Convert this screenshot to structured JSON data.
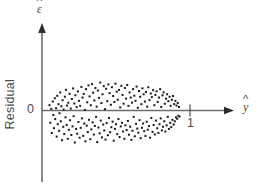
{
  "figure": {
    "background_color": "#ffffff",
    "axis_color": "#6d6d6d",
    "point_color": "#1a1a1a",
    "text_color": "#4d4d4d"
  },
  "labels": {
    "yaxis_name": "Residual",
    "yaxis_symbol_base": "ε",
    "xaxis_symbol_base": "y",
    "ytick_zero": "0",
    "xtick_one": "1"
  },
  "chart_data": {
    "type": "scatter",
    "title": "",
    "subtitle": "",
    "xlabel": "ŷ",
    "ylabel": "ε̂",
    "ylabel_text": "Residual",
    "grid": false,
    "legend": "none",
    "xlim": [
      0,
      1.35
    ],
    "ylim": [
      -0.62,
      0.62
    ],
    "xticks": [
      1
    ],
    "xticklabels": [
      "1"
    ],
    "yticks": [
      0
    ],
    "yticklabels": [
      "0"
    ],
    "annotations": [],
    "point_count": 360,
    "marker": "square",
    "marker_size_px": 2,
    "points": [
      [
        0.055,
        0.049
      ],
      [
        0.061,
        -0.112
      ],
      [
        0.068,
        0.015
      ],
      [
        0.072,
        -0.205
      ],
      [
        0.079,
        0.082
      ],
      [
        0.083,
        -0.041
      ],
      [
        0.088,
        -0.161
      ],
      [
        0.094,
        0.112
      ],
      [
        0.097,
        -0.078
      ],
      [
        0.103,
        0.021
      ],
      [
        0.108,
        -0.238
      ],
      [
        0.112,
        0.134
      ],
      [
        0.116,
        -0.125
      ],
      [
        0.121,
        0.058
      ],
      [
        0.125,
        -0.185
      ],
      [
        0.129,
        -0.025
      ],
      [
        0.134,
        0.165
      ],
      [
        0.138,
        -0.098
      ],
      [
        0.142,
        0.038
      ],
      [
        0.147,
        -0.271
      ],
      [
        0.151,
        0.094
      ],
      [
        0.156,
        -0.149
      ],
      [
        0.159,
        0.008
      ],
      [
        0.163,
        -0.215
      ],
      [
        0.168,
        0.126
      ],
      [
        0.172,
        -0.062
      ],
      [
        0.176,
        0.188
      ],
      [
        0.181,
        -0.132
      ],
      [
        0.184,
        0.045
      ],
      [
        0.189,
        -0.258
      ],
      [
        0.193,
        0.071
      ],
      [
        0.197,
        -0.176
      ],
      [
        0.202,
        0.152
      ],
      [
        0.206,
        -0.089
      ],
      [
        0.211,
        0.018
      ],
      [
        0.215,
        -0.224
      ],
      [
        0.219,
        0.105
      ],
      [
        0.224,
        -0.145
      ],
      [
        0.228,
        0.201
      ],
      [
        0.232,
        -0.052
      ],
      [
        0.237,
        0.064
      ],
      [
        0.241,
        -0.292
      ],
      [
        0.245,
        0.139
      ],
      [
        0.25,
        -0.168
      ],
      [
        0.254,
        0.031
      ],
      [
        0.258,
        -0.212
      ],
      [
        0.263,
        0.174
      ],
      [
        0.267,
        -0.105
      ],
      [
        0.271,
        0.088
      ],
      [
        0.276,
        -0.248
      ],
      [
        0.28,
        0.042
      ],
      [
        0.284,
        -0.158
      ],
      [
        0.289,
        0.215
      ],
      [
        0.293,
        -0.072
      ],
      [
        0.297,
        0.118
      ],
      [
        0.302,
        -0.231
      ],
      [
        0.306,
        0.151
      ],
      [
        0.31,
        -0.119
      ],
      [
        0.315,
        0.005
      ],
      [
        0.319,
        -0.281
      ],
      [
        0.323,
        0.195
      ],
      [
        0.328,
        -0.138
      ],
      [
        0.332,
        0.075
      ],
      [
        0.336,
        -0.196
      ],
      [
        0.341,
        0.229
      ],
      [
        0.345,
        -0.085
      ],
      [
        0.349,
        0.128
      ],
      [
        0.354,
        -0.262
      ],
      [
        0.358,
        0.048
      ],
      [
        0.362,
        -0.172
      ],
      [
        0.367,
        0.241
      ],
      [
        0.371,
        -0.108
      ],
      [
        0.375,
        0.162
      ],
      [
        0.38,
        -0.219
      ],
      [
        0.384,
        0.092
      ],
      [
        0.388,
        -0.141
      ],
      [
        0.392,
        0.205
      ],
      [
        0.397,
        -0.058
      ],
      [
        0.401,
        0.035
      ],
      [
        0.405,
        -0.288
      ],
      [
        0.41,
        0.182
      ],
      [
        0.414,
        -0.155
      ],
      [
        0.418,
        0.115
      ],
      [
        0.423,
        -0.208
      ],
      [
        0.427,
        0.255
      ],
      [
        0.431,
        -0.092
      ],
      [
        0.436,
        0.068
      ],
      [
        0.44,
        -0.245
      ],
      [
        0.444,
        0.148
      ],
      [
        0.449,
        -0.128
      ],
      [
        0.453,
        0.222
      ],
      [
        0.457,
        -0.182
      ],
      [
        0.462,
        0.012
      ],
      [
        0.466,
        -0.265
      ],
      [
        0.47,
        0.198
      ],
      [
        0.474,
        -0.115
      ],
      [
        0.479,
        0.085
      ],
      [
        0.483,
        -0.225
      ],
      [
        0.487,
        0.238
      ],
      [
        0.492,
        -0.068
      ],
      [
        0.496,
        0.158
      ],
      [
        0.5,
        -0.198
      ],
      [
        0.505,
        0.052
      ],
      [
        0.509,
        -0.152
      ],
      [
        0.513,
        0.212
      ],
      [
        0.518,
        -0.102
      ],
      [
        0.522,
        0.132
      ],
      [
        0.526,
        -0.275
      ],
      [
        0.531,
        0.078
      ],
      [
        0.535,
        -0.168
      ],
      [
        0.539,
        0.245
      ],
      [
        0.543,
        -0.125
      ],
      [
        0.548,
        0.172
      ],
      [
        0.552,
        -0.215
      ],
      [
        0.556,
        0.098
      ],
      [
        0.561,
        -0.078
      ],
      [
        0.565,
        0.188
      ],
      [
        0.569,
        -0.242
      ],
      [
        0.574,
        0.028
      ],
      [
        0.578,
        -0.145
      ],
      [
        0.582,
        0.225
      ],
      [
        0.587,
        -0.112
      ],
      [
        0.591,
        0.142
      ],
      [
        0.595,
        -0.192
      ],
      [
        0.599,
        0.062
      ],
      [
        0.604,
        -0.258
      ],
      [
        0.608,
        0.205
      ],
      [
        0.612,
        -0.135
      ],
      [
        0.617,
        0.108
      ],
      [
        0.621,
        -0.178
      ],
      [
        0.625,
        0.232
      ],
      [
        0.63,
        -0.095
      ],
      [
        0.634,
        0.042
      ],
      [
        0.638,
        -0.221
      ],
      [
        0.643,
        0.165
      ],
      [
        0.647,
        -0.148
      ],
      [
        0.651,
        0.118
      ],
      [
        0.656,
        -0.268
      ],
      [
        0.66,
        0.072
      ],
      [
        0.664,
        -0.185
      ],
      [
        0.668,
        0.195
      ],
      [
        0.673,
        -0.058
      ],
      [
        0.677,
        0.135
      ],
      [
        0.681,
        -0.235
      ],
      [
        0.686,
        0.088
      ],
      [
        0.69,
        -0.122
      ],
      [
        0.694,
        0.218
      ],
      [
        0.699,
        -0.165
      ],
      [
        0.703,
        0.025
      ],
      [
        0.707,
        -0.202
      ],
      [
        0.712,
        0.178
      ],
      [
        0.716,
        -0.088
      ],
      [
        0.72,
        0.125
      ],
      [
        0.724,
        -0.252
      ],
      [
        0.729,
        0.058
      ],
      [
        0.733,
        -0.158
      ],
      [
        0.737,
        0.202
      ],
      [
        0.742,
        -0.118
      ],
      [
        0.746,
        0.148
      ],
      [
        0.75,
        -0.188
      ],
      [
        0.755,
        0.082
      ],
      [
        0.759,
        -0.232
      ],
      [
        0.763,
        0.168
      ],
      [
        0.768,
        -0.102
      ],
      [
        0.772,
        0.035
      ],
      [
        0.776,
        -0.175
      ],
      [
        0.78,
        0.212
      ],
      [
        0.785,
        -0.142
      ],
      [
        0.789,
        0.095
      ],
      [
        0.793,
        -0.248
      ],
      [
        0.798,
        0.155
      ],
      [
        0.802,
        -0.068
      ],
      [
        0.806,
        0.122
      ],
      [
        0.811,
        -0.195
      ],
      [
        0.815,
        0.185
      ],
      [
        0.819,
        -0.132
      ],
      [
        0.824,
        0.048
      ],
      [
        0.828,
        -0.218
      ],
      [
        0.832,
        0.142
      ],
      [
        0.836,
        -0.092
      ],
      [
        0.841,
        0.175
      ],
      [
        0.845,
        -0.162
      ],
      [
        0.849,
        0.078
      ],
      [
        0.854,
        -0.205
      ],
      [
        0.858,
        0.118
      ],
      [
        0.862,
        -0.125
      ],
      [
        0.867,
        0.195
      ],
      [
        0.871,
        -0.072
      ],
      [
        0.875,
        0.032
      ],
      [
        0.88,
        -0.182
      ],
      [
        0.884,
        0.138
      ],
      [
        0.888,
        -0.148
      ],
      [
        0.892,
        0.165
      ],
      [
        0.897,
        -0.098
      ],
      [
        0.901,
        0.062
      ],
      [
        0.905,
        -0.192
      ],
      [
        0.91,
        0.108
      ],
      [
        0.914,
        -0.135
      ],
      [
        0.918,
        0.148
      ],
      [
        0.923,
        -0.058
      ],
      [
        0.927,
        0.085
      ],
      [
        0.931,
        -0.168
      ],
      [
        0.936,
        0.125
      ],
      [
        0.94,
        -0.112
      ],
      [
        0.944,
        0.042
      ],
      [
        0.948,
        -0.152
      ],
      [
        0.953,
        0.098
      ],
      [
        0.957,
        -0.085
      ],
      [
        0.961,
        0.132
      ],
      [
        0.966,
        -0.128
      ],
      [
        0.97,
        0.058
      ],
      [
        0.974,
        -0.098
      ],
      [
        0.979,
        0.088
      ],
      [
        0.983,
        -0.062
      ],
      [
        0.987,
        0.045
      ],
      [
        0.992,
        -0.075
      ],
      [
        0.996,
        0.068
      ],
      [
        1.001,
        -0.048
      ],
      [
        1.005,
        0.032
      ],
      [
        1.009,
        -0.055
      ]
    ]
  }
}
